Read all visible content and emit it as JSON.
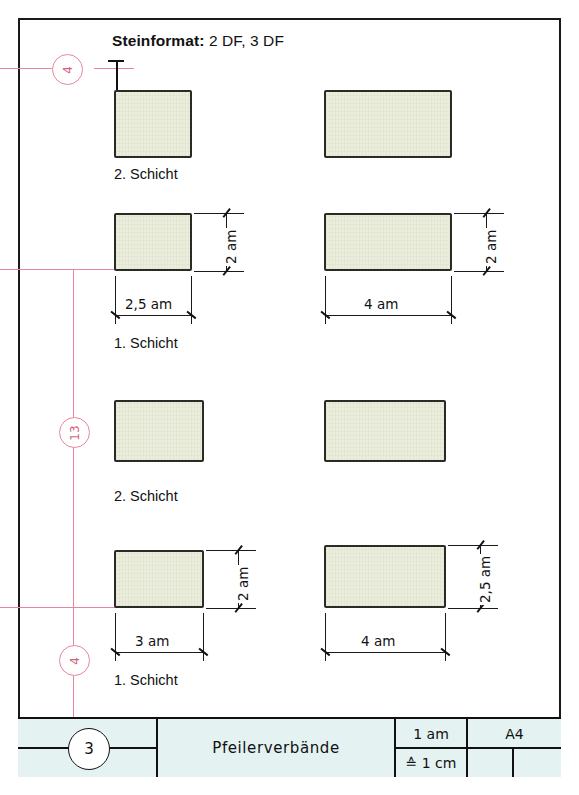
{
  "header": {
    "label": "Steinformat:",
    "value": "2 DF, 3 DF"
  },
  "markers": {
    "top": "4",
    "middle": "13",
    "bottom": "4"
  },
  "columns": [
    {
      "name": "left",
      "rows": [
        {
          "caption": "2. Schicht",
          "width": "",
          "height": ""
        },
        {
          "caption": "1. Schicht",
          "width": "2,5 am",
          "height": "2 am"
        },
        {
          "caption": "2. Schicht",
          "width": "",
          "height": ""
        },
        {
          "caption": "1. Schicht",
          "width": "3 am",
          "height": "2 am"
        }
      ]
    },
    {
      "name": "right",
      "rows": [
        {
          "caption": "",
          "width": "",
          "height": ""
        },
        {
          "caption": "",
          "width": "4 am",
          "height": "2 am"
        },
        {
          "caption": "",
          "width": "",
          "height": ""
        },
        {
          "caption": "",
          "width": "4 am",
          "height": "2,5 am"
        }
      ]
    }
  ],
  "titleblock": {
    "sheet_number": "3",
    "drawing_title": "Pfeilerverbände",
    "scale_top": "1 am",
    "scale_bottom": "≙ 1 cm",
    "paper_format": "A4"
  },
  "colors": {
    "brick_fill": "#ebeedc",
    "brick_outline": "#2b2b25",
    "construction_red": "#e8879c",
    "titleblock_bg": "#e4f2f2",
    "frame": "#1a1a1a"
  }
}
